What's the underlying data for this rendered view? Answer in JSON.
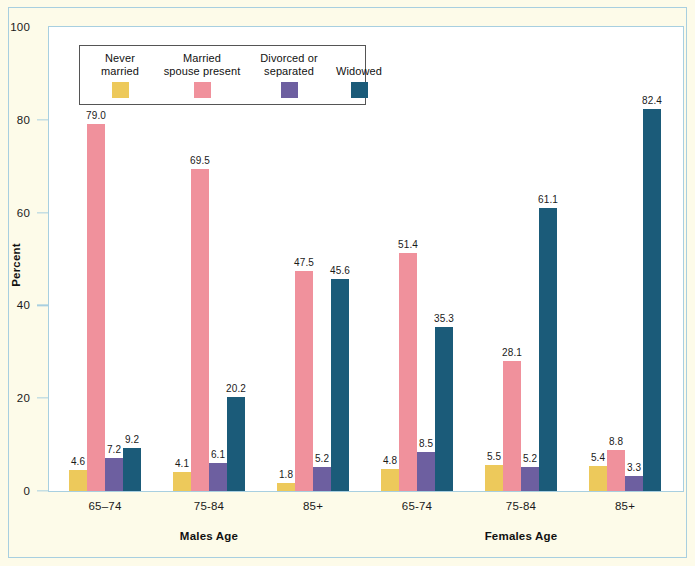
{
  "chart_data": {
    "type": "bar",
    "title": "",
    "xlabel": "",
    "ylabel": "Percent",
    "ylim": [
      0,
      100
    ],
    "yticks": [
      0,
      20,
      40,
      60,
      80,
      100
    ],
    "grid": false,
    "legend_position": "inside-top-left",
    "categories": [
      "65–74",
      "75-84",
      "85+",
      "65-74",
      "75-84",
      "85+"
    ],
    "sections": [
      {
        "label": "Males Age",
        "categories": [
          "65–74",
          "75-84",
          "85+"
        ]
      },
      {
        "label": "Females Age",
        "categories": [
          "65-74",
          "75-84",
          "85+"
        ]
      }
    ],
    "series": [
      {
        "name": "Never married",
        "color": "#edc95b",
        "values": [
          4.6,
          4.1,
          1.8,
          4.8,
          5.5,
          5.4
        ],
        "labels": [
          "4.6",
          "4.1",
          "1.8",
          "4.8",
          "5.5",
          "5.4"
        ]
      },
      {
        "name": "Married spouse present",
        "color": "#f0919c",
        "values": [
          79.0,
          69.5,
          47.5,
          51.4,
          28.1,
          8.8
        ],
        "labels": [
          "79.0",
          "69.5",
          "47.5",
          "51.4",
          "28.1",
          "8.8"
        ]
      },
      {
        "name": "Divorced or separated",
        "color": "#6d5fa0",
        "values": [
          7.2,
          6.1,
          5.2,
          8.5,
          5.2,
          3.3
        ],
        "labels": [
          "7.2",
          "6.1",
          "5.2",
          "8.5",
          "5.2",
          "3.3"
        ]
      },
      {
        "name": "Widowed",
        "color": "#1b5b79",
        "values": [
          9.2,
          20.2,
          45.6,
          35.3,
          61.1,
          82.4
        ],
        "labels": [
          "9.2",
          "20.2",
          "45.6",
          "35.3",
          "61.1",
          "82.4"
        ]
      }
    ]
  },
  "legend": {
    "items": [
      {
        "lines": [
          "Never",
          "married"
        ],
        "color": "#edc95b"
      },
      {
        "lines": [
          "Married",
          "spouse present"
        ],
        "color": "#f0919c"
      },
      {
        "lines": [
          "Divorced or",
          "separated"
        ],
        "color": "#6d5fa0"
      },
      {
        "lines": [
          "Widowed"
        ],
        "color": "#1b5b79"
      }
    ]
  },
  "colors": {
    "page_background": "#fdfbe9",
    "plot_background": "#ffffff",
    "frame_rule": "#a8cfe0",
    "text": "#1a1a1a"
  }
}
